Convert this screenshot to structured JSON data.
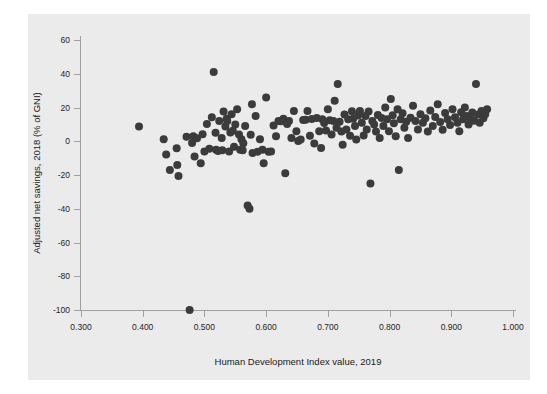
{
  "figure": {
    "background_color": "#ffffff",
    "canvas_color": "#ebebeb",
    "point_color": "#3b3b3b",
    "axis_color": "#a0a0a0",
    "text_color": "#1a1a1a"
  },
  "chart_data": {
    "type": "scatter",
    "title": "",
    "subtitle": "",
    "xlabel": "Human Development Index value, 2019",
    "ylabel": "Adjusted net savings, 2018 (% of GNI)",
    "xlim": [
      0.285,
      1.015
    ],
    "ylim": [
      -105,
      68
    ],
    "xticks": [
      0.3,
      0.4,
      0.5,
      0.6,
      0.7,
      0.8,
      0.9,
      1.0
    ],
    "xticklabels": [
      "0.300",
      "0.400",
      "0.500",
      "0.600",
      "0.700",
      "0.800",
      "0.900",
      "1.000"
    ],
    "yticks": [
      60,
      40,
      20,
      0,
      -20,
      -40,
      -60,
      -80,
      -100
    ],
    "yticklabels": [
      "60",
      "40",
      "20",
      "0",
      "-20",
      "-40",
      "-60",
      "-80",
      "-100"
    ],
    "grid": false,
    "legend": null,
    "annotations": [],
    "marker": {
      "shape": "circle",
      "size_px": 4.2,
      "color": "#3b3b3b"
    },
    "series": [
      {
        "name": "Countries",
        "points": [
          [
            0.394,
            8.8
          ],
          [
            0.434,
            1.2
          ],
          [
            0.438,
            -7.8
          ],
          [
            0.444,
            -17.0
          ],
          [
            0.455,
            -4.2
          ],
          [
            0.456,
            -14.0
          ],
          [
            0.458,
            -20.6
          ],
          [
            0.471,
            2.6
          ],
          [
            0.476,
            -100.0
          ],
          [
            0.48,
            -1.0
          ],
          [
            0.482,
            3.0
          ],
          [
            0.484,
            -9.0
          ],
          [
            0.488,
            1.8
          ],
          [
            0.494,
            -13.0
          ],
          [
            0.497,
            4.2
          ],
          [
            0.5,
            -6.0
          ],
          [
            0.504,
            10.2
          ],
          [
            0.508,
            -4.5
          ],
          [
            0.512,
            14.2
          ],
          [
            0.515,
            41.0
          ],
          [
            0.518,
            5.0
          ],
          [
            0.519,
            -5.0
          ],
          [
            0.522,
            -5.8
          ],
          [
            0.524,
            12.0
          ],
          [
            0.528,
            2.0
          ],
          [
            0.529,
            -5.4
          ],
          [
            0.531,
            17.6
          ],
          [
            0.534,
            8.8
          ],
          [
            0.536,
            13.4
          ],
          [
            0.537,
            12.0
          ],
          [
            0.54,
            -6.0
          ],
          [
            0.542,
            5.2
          ],
          [
            0.544,
            16.0
          ],
          [
            0.546,
            6.2
          ],
          [
            0.548,
            -3.2
          ],
          [
            0.55,
            10.0
          ],
          [
            0.553,
            19.0
          ],
          [
            0.556,
            4.0
          ],
          [
            0.558,
            -5.0
          ],
          [
            0.56,
            1.2
          ],
          [
            0.562,
            -5.4
          ],
          [
            0.563,
            -1.2
          ],
          [
            0.566,
            9.0
          ],
          [
            0.57,
            -38.0
          ],
          [
            0.573,
            -40.0
          ],
          [
            0.575,
            3.8
          ],
          [
            0.577,
            22.0
          ],
          [
            0.578,
            -7.0
          ],
          [
            0.583,
            15.0
          ],
          [
            0.586,
            -6.2
          ],
          [
            0.59,
            1.2
          ],
          [
            0.594,
            -5.0
          ],
          [
            0.596,
            -13.0
          ],
          [
            0.6,
            26.0
          ],
          [
            0.604,
            -6.2
          ],
          [
            0.608,
            -6.0
          ],
          [
            0.612,
            9.4
          ],
          [
            0.616,
            3.0
          ],
          [
            0.62,
            12.0
          ],
          [
            0.624,
            11.8
          ],
          [
            0.628,
            13.4
          ],
          [
            0.631,
            -19.0
          ],
          [
            0.634,
            10.2
          ],
          [
            0.637,
            12.0
          ],
          [
            0.641,
            2.0
          ],
          [
            0.645,
            18.0
          ],
          [
            0.649,
            6.0
          ],
          [
            0.652,
            0.2
          ],
          [
            0.656,
            1.0
          ],
          [
            0.66,
            12.6
          ],
          [
            0.664,
            12.8
          ],
          [
            0.667,
            18.0
          ],
          [
            0.671,
            3.2
          ],
          [
            0.674,
            13.2
          ],
          [
            0.678,
            -1.4
          ],
          [
            0.682,
            13.8
          ],
          [
            0.686,
            6.0
          ],
          [
            0.689,
            -4.0
          ],
          [
            0.691,
            13.0
          ],
          [
            0.694,
            10.8
          ],
          [
            0.697,
            6.4
          ],
          [
            0.7,
            19.0
          ],
          [
            0.703,
            12.4
          ],
          [
            0.706,
            4.0
          ],
          [
            0.709,
            12.0
          ],
          [
            0.711,
            24.0
          ],
          [
            0.714,
            8.0
          ],
          [
            0.716,
            34.0
          ],
          [
            0.719,
            11.6
          ],
          [
            0.722,
            5.8
          ],
          [
            0.724,
            -2.0
          ],
          [
            0.727,
            15.8
          ],
          [
            0.73,
            7.0
          ],
          [
            0.733,
            13.0
          ],
          [
            0.736,
            3.2
          ],
          [
            0.739,
            17.8
          ],
          [
            0.741,
            13.4
          ],
          [
            0.744,
            9.0
          ],
          [
            0.746,
            1.0
          ],
          [
            0.749,
            15.2
          ],
          [
            0.752,
            18.0
          ],
          [
            0.755,
            11.0
          ],
          [
            0.758,
            3.4
          ],
          [
            0.761,
            15.0
          ],
          [
            0.763,
            7.0
          ],
          [
            0.766,
            17.6
          ],
          [
            0.769,
            -25.0
          ],
          [
            0.772,
            12.0
          ],
          [
            0.775,
            10.0
          ],
          [
            0.778,
            5.8
          ],
          [
            0.781,
            15.6
          ],
          [
            0.784,
            2.0
          ],
          [
            0.787,
            13.8
          ],
          [
            0.79,
            9.0
          ],
          [
            0.793,
            20.0
          ],
          [
            0.796,
            13.0
          ],
          [
            0.799,
            6.0
          ],
          [
            0.802,
            25.0
          ],
          [
            0.805,
            15.4
          ],
          [
            0.807,
            10.6
          ],
          [
            0.81,
            3.0
          ],
          [
            0.813,
            19.0
          ],
          [
            0.815,
            -17.0
          ],
          [
            0.818,
            13.0
          ],
          [
            0.821,
            16.6
          ],
          [
            0.824,
            8.0
          ],
          [
            0.827,
            11.6
          ],
          [
            0.83,
            2.0
          ],
          [
            0.834,
            14.0
          ],
          [
            0.838,
            21.0
          ],
          [
            0.842,
            12.0
          ],
          [
            0.846,
            7.0
          ],
          [
            0.85,
            16.0
          ],
          [
            0.854,
            11.0
          ],
          [
            0.858,
            13.6
          ],
          [
            0.862,
            5.8
          ],
          [
            0.866,
            18.2
          ],
          [
            0.87,
            9.0
          ],
          [
            0.874,
            14.4
          ],
          [
            0.878,
            22.0
          ],
          [
            0.882,
            11.4
          ],
          [
            0.886,
            6.8
          ],
          [
            0.89,
            16.8
          ],
          [
            0.894,
            13.0
          ],
          [
            0.898,
            9.6
          ],
          [
            0.902,
            19.0
          ],
          [
            0.906,
            14.2
          ],
          [
            0.91,
            11.0
          ],
          [
            0.913,
            6.0
          ],
          [
            0.916,
            17.2
          ],
          [
            0.919,
            13.0
          ],
          [
            0.922,
            20.0
          ],
          [
            0.925,
            15.0
          ],
          [
            0.928,
            10.0
          ],
          [
            0.931,
            13.4
          ],
          [
            0.934,
            17.0
          ],
          [
            0.937,
            12.2
          ],
          [
            0.94,
            34.0
          ],
          [
            0.943,
            15.8
          ],
          [
            0.946,
            11.0
          ],
          [
            0.949,
            18.0
          ],
          [
            0.952,
            13.6
          ],
          [
            0.955,
            16.0
          ],
          [
            0.958,
            19.0
          ]
        ]
      }
    ]
  }
}
